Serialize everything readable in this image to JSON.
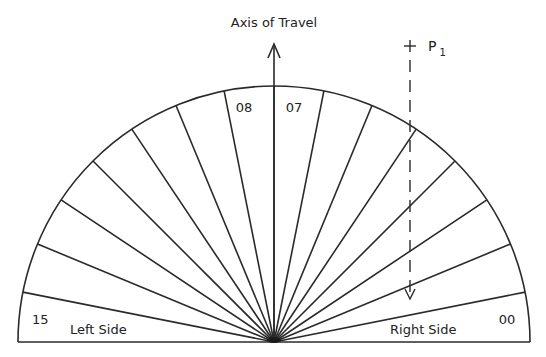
{
  "diagram": {
    "axis_label": "Axis of Travel",
    "point_label": "P",
    "point_subscript": "1",
    "left_side_label": "Left Side",
    "right_side_label": "Right Side",
    "sector_labels": {
      "rightmost": "00",
      "center_right": "07",
      "center_left": "08",
      "leftmost": "15"
    },
    "sector_count": 16,
    "colors": {
      "stroke": "#2a2a2a",
      "background": "#ffffff"
    }
  }
}
